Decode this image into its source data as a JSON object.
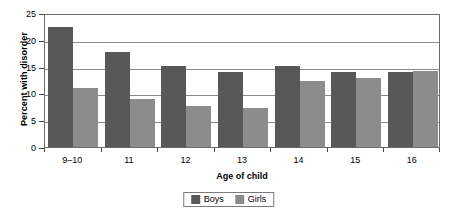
{
  "chart_data": {
    "type": "bar",
    "title": "",
    "xlabel": "Age of child",
    "ylabel": "Percent with disorder",
    "categories": [
      "9–10",
      "11",
      "12",
      "13",
      "14",
      "15",
      "16"
    ],
    "series": [
      {
        "name": "Boys",
        "color": "#585858",
        "values": [
          22.3,
          17.7,
          15.1,
          14.0,
          15.2,
          14.0,
          14.0
        ]
      },
      {
        "name": "Girls",
        "color": "#8c8c8c",
        "values": [
          11.0,
          8.9,
          7.7,
          7.3,
          12.4,
          12.8,
          14.2
        ]
      }
    ],
    "ylim": [
      0,
      25
    ],
    "yticks": [
      0,
      5,
      10,
      15,
      20,
      25
    ],
    "ytick_labels": [
      "0",
      "5",
      "10",
      "15",
      "20",
      "25"
    ],
    "grid": true,
    "legend_position": "bottom-center"
  }
}
